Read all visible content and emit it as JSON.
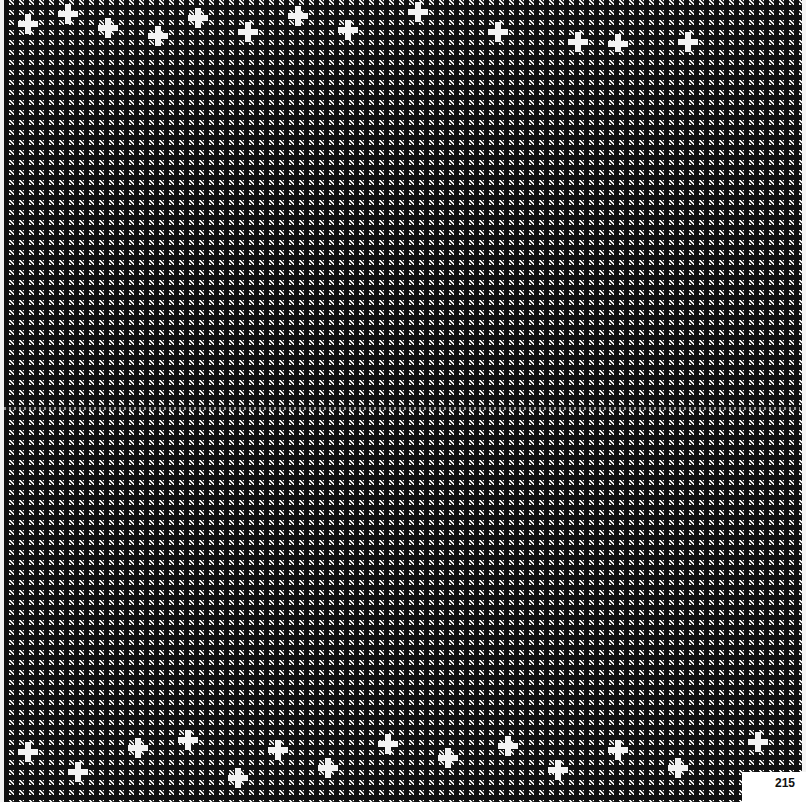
{
  "page": {
    "type": "textile-pattern-plate",
    "pattern": "black-and-white check / houndstooth weave",
    "colors": {
      "dark": "#111111",
      "light": "#f2f2f2"
    },
    "page_number": "215"
  }
}
